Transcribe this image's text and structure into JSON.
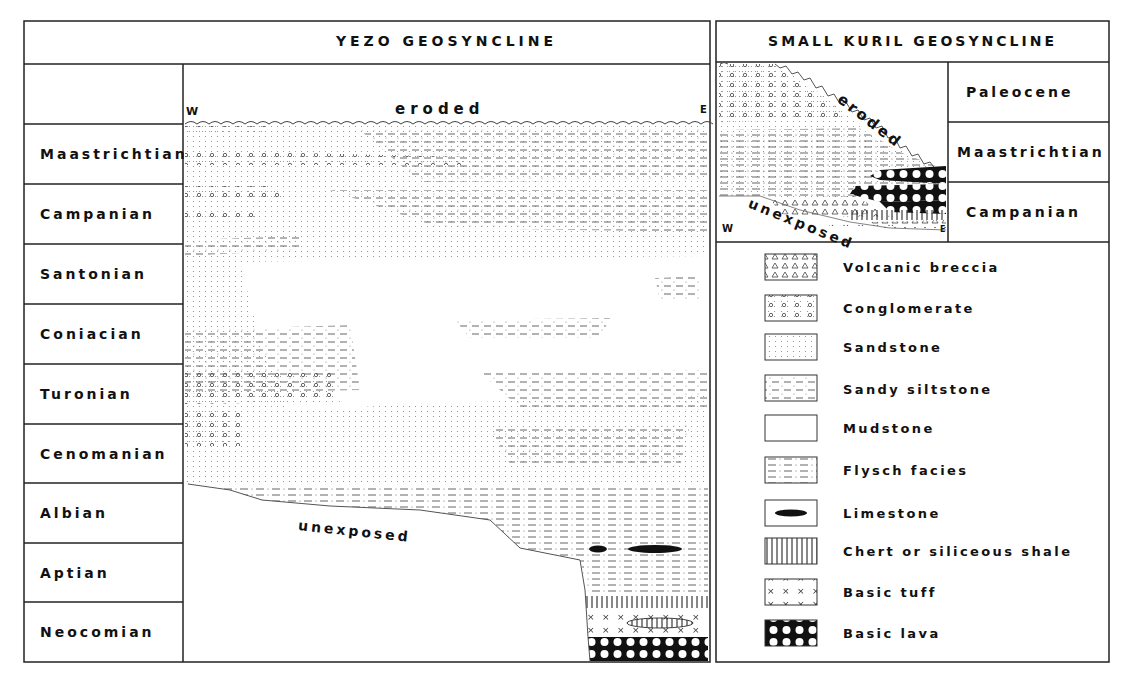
{
  "yezo": {
    "title": "YEZO    GEOSYNCLINE",
    "direction_west": "W",
    "direction_east": "E",
    "eroded_label": "eroded",
    "unexposed_label": "unexposed",
    "stages": [
      {
        "label": "Maastrichtian"
      },
      {
        "label": "Campanian"
      },
      {
        "label": "Santonian"
      },
      {
        "label": "Coniacian"
      },
      {
        "label": "Turonian"
      },
      {
        "label": "Cenomanian"
      },
      {
        "label": "Albian"
      },
      {
        "label": "Aptian"
      },
      {
        "label": "Neocomian"
      }
    ]
  },
  "kuril": {
    "title": "SMALL KURIL GEOSYNCLINE",
    "direction_west": "W",
    "direction_east": "E",
    "eroded_label": "eroded",
    "unexposed_label": "unexposed",
    "stages": [
      {
        "label": "Paleocene"
      },
      {
        "label": "Maastrichtian"
      },
      {
        "label": "Campanian"
      }
    ]
  },
  "legend": {
    "items": [
      {
        "label": "Volcanic breccia",
        "pattern": "triangles"
      },
      {
        "label": "Conglomerate",
        "pattern": "circles"
      },
      {
        "label": "Sandstone",
        "pattern": "dots"
      },
      {
        "label": "Sandy siltstone",
        "pattern": "dashes-dots"
      },
      {
        "label": "Mudstone",
        "pattern": "blank"
      },
      {
        "label": "Flysch facies",
        "pattern": "dash-dot-lines"
      },
      {
        "label": "Limestone",
        "pattern": "black-lens"
      },
      {
        "label": "Chert or siliceous shale",
        "pattern": "vertical-lines"
      },
      {
        "label": "Basic tuff",
        "pattern": "crosses"
      },
      {
        "label": "Basic lava",
        "pattern": "black-with-white-circles"
      }
    ]
  },
  "colors": {
    "ink": "#111111",
    "paper": "#ffffff",
    "pattern": "#777777"
  }
}
